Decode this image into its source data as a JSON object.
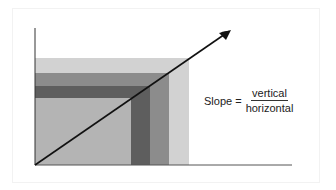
{
  "formula": {
    "lhs": "Slope =",
    "numerator": "vertical",
    "denominator": "horizontal"
  },
  "colors": {
    "light_band": "#d2d2d2",
    "medium_band": "#8c8c8c",
    "dark_band": "#5e5e5e",
    "inner_fill": "#b4b4b4",
    "axis": "#333333",
    "arrow": "#111111"
  },
  "elements": {
    "axes": "x-axis and y-axis",
    "arrow": "line from origin rising to upper right",
    "rectangles": [
      "light outer rectangle",
      "medium nested L-band",
      "dark nested L-band",
      "inner fill rectangle"
    ]
  }
}
